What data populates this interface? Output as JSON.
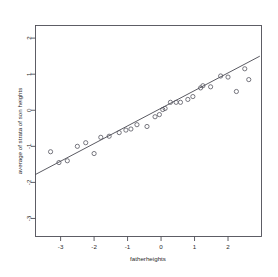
{
  "chart_data": {
    "type": "scatter",
    "title": "",
    "subtitle": "",
    "xlabel": "fatherheights",
    "ylabel": "average of strata of son heights",
    "xlim": [
      -3.75,
      3.0
    ],
    "ylim": [
      -3.5,
      2.35
    ],
    "xticks": [
      -3,
      -2,
      -1,
      0,
      1,
      2
    ],
    "xtick_labels": [
      "-3",
      "-2",
      "-1",
      "0",
      "1",
      "2"
    ],
    "yticks": [
      2,
      1,
      0,
      -1,
      -2,
      -3
    ],
    "ytick_labels": [
      "2",
      "1",
      "0",
      "-1",
      "-2",
      "-3"
    ],
    "grid": false,
    "legend": false,
    "legend_position": "none",
    "marker": "open-circle",
    "marker_size": 2.1,
    "point_color": "#55555f",
    "line_color": "#3c3c46",
    "frame_color": "#4d4d55",
    "background_color": "#ffffff",
    "series": [
      {
        "name": "strata averages",
        "points": [
          [
            -3.3,
            -1.15
          ],
          [
            -3.05,
            -1.45
          ],
          [
            -2.8,
            -1.4
          ],
          [
            -2.5,
            -1.0
          ],
          [
            -2.25,
            -0.9
          ],
          [
            -2.0,
            -1.2
          ],
          [
            -1.8,
            -0.75
          ],
          [
            -1.55,
            -0.72
          ],
          [
            -1.25,
            -0.62
          ],
          [
            -1.05,
            -0.55
          ],
          [
            -0.9,
            -0.52
          ],
          [
            -0.72,
            -0.4
          ],
          [
            -0.42,
            -0.45
          ],
          [
            -0.18,
            -0.18
          ],
          [
            -0.05,
            -0.12
          ],
          [
            0.05,
            0.02
          ],
          [
            0.12,
            0.05
          ],
          [
            0.28,
            0.22
          ],
          [
            0.45,
            0.22
          ],
          [
            0.58,
            0.22
          ],
          [
            0.8,
            0.3
          ],
          [
            0.95,
            0.38
          ],
          [
            1.18,
            0.62
          ],
          [
            1.25,
            0.68
          ],
          [
            1.48,
            0.65
          ],
          [
            1.78,
            0.95
          ],
          [
            2.0,
            0.92
          ],
          [
            2.25,
            0.52
          ],
          [
            2.5,
            1.15
          ],
          [
            2.62,
            0.85
          ]
        ]
      }
    ],
    "fit_line": {
      "name": "regression line",
      "x_start": -3.75,
      "y_start": -1.78,
      "x_end": 2.95,
      "y_end": 1.5,
      "slope": 0.489,
      "intercept": 0.055
    }
  }
}
